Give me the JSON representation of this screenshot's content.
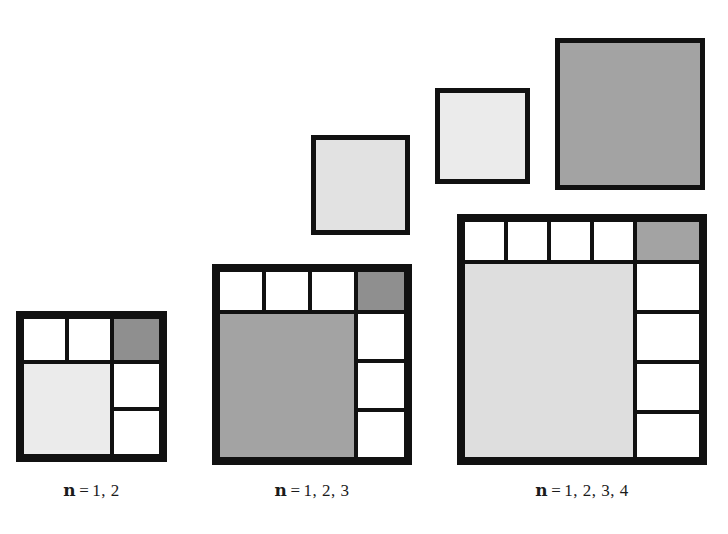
{
  "diagram": {
    "background_color": "#ffffff",
    "stroke_color": "#111111",
    "palette": {
      "white": "#ffffff",
      "very_light_gray": "#ebebeb",
      "light_gray": "#dedede",
      "medium_gray": "#a3a3a3",
      "dark_gray": "#8f8f8f"
    }
  },
  "figures": [
    {
      "id": "figure-n12",
      "caption": {
        "symbol": "n",
        "equals": "=",
        "value": "1, 2"
      },
      "order": 2,
      "outer_square_units": 3,
      "top_row": {
        "white_cells": 2,
        "accent_cells": 1,
        "accent_shade": "dark_gray"
      },
      "main_block": {
        "units": 2,
        "shade": "very_light_gray"
      },
      "right_column": {
        "white_cells": 2
      }
    },
    {
      "id": "figure-n123",
      "caption": {
        "symbol": "n",
        "equals": "=",
        "value": "1, 2, 3"
      },
      "order": 3,
      "outer_square_units": 4,
      "top_row": {
        "white_cells": 3,
        "accent_cells": 1,
        "accent_shade": "dark_gray"
      },
      "main_block": {
        "units": 3,
        "shade": "medium_gray"
      },
      "right_column": {
        "white_cells": 3
      }
    },
    {
      "id": "figure-n1234",
      "caption": {
        "symbol": "n",
        "equals": "=",
        "value": "1, 2, 3, 4"
      },
      "order": 4,
      "outer_square_units": 5,
      "top_row": {
        "white_cells": 4,
        "accent_cells": 1,
        "accent_shade": "medium_gray"
      },
      "main_block": {
        "units": 4,
        "shade": "light_gray"
      },
      "right_column": {
        "white_cells": 4
      }
    }
  ],
  "lone_squares": [
    {
      "id": "lone-square-2",
      "shade": "light_gray",
      "units": 2
    },
    {
      "id": "lone-square-3",
      "shade": "very_light_gray",
      "units": 3
    },
    {
      "id": "lone-square-4",
      "shade": "medium_gray",
      "units": 4
    }
  ],
  "captions": {
    "figure_1": "n = 1, 2",
    "figure_2": "n = 1, 2, 3",
    "figure_3": "n = 1, 2, 3, 4"
  }
}
